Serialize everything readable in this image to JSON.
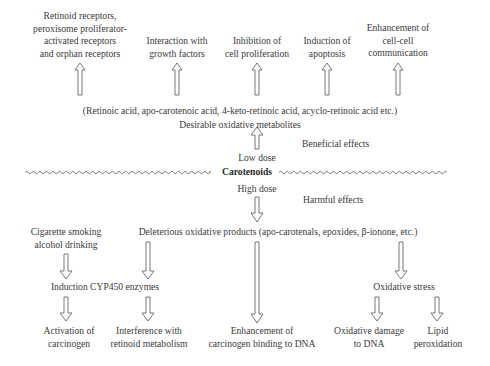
{
  "diagram": {
    "center": {
      "label": "Carotenoids",
      "low_dose": "Low dose",
      "high_dose": "High dose"
    },
    "beneficial": {
      "section_label": "Beneficial effects",
      "metabolites_examples": "(Retinoic acid, apo-carotenoic acid, 4-keto-retinoic acid, acyclo-retinoic acid etc.)",
      "metabolites_title": "Desirable oxidative metabolites",
      "effects": [
        {
          "lines": [
            "Retinoid receptors,",
            "peroxisome proliferator-",
            "activated receptors",
            "and orphan receptors"
          ]
        },
        {
          "lines": [
            "Interaction with",
            "growth factors"
          ]
        },
        {
          "lines": [
            "Inhibition of",
            "cell proliferation"
          ]
        },
        {
          "lines": [
            "Induction of",
            "apoptosis"
          ]
        },
        {
          "lines": [
            "Enhancement of",
            "cell-cell",
            "communication"
          ]
        }
      ]
    },
    "harmful": {
      "section_label": "Harmful effects",
      "products": "Deleterious oxidative products (apo-carotenals, epoxides, β-ionone, etc.)",
      "cofactor": {
        "lines": [
          "Cigarette smoking",
          "alcohol drinking"
        ]
      },
      "intermediate_cyp": "Induction CYP450 enzymes",
      "intermediate_ox": "Oxidative stress",
      "outcomes": [
        {
          "lines": [
            "Activation of",
            "carcinogen"
          ]
        },
        {
          "lines": [
            "Interference with",
            "retinoid metabolism"
          ]
        },
        {
          "lines": [
            "Enhancement of",
            "carcinogen binding to DNA"
          ]
        },
        {
          "lines": [
            "Oxidative damage",
            "to DNA"
          ]
        },
        {
          "lines": [
            "Lipid",
            "peroxidation"
          ]
        }
      ]
    },
    "colors": {
      "text": "#3a3a3a",
      "arrow_stroke": "#555555",
      "background": "#ffffff"
    }
  }
}
